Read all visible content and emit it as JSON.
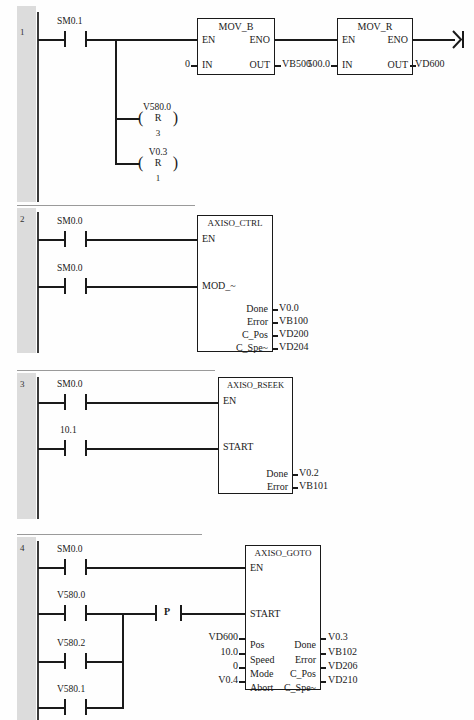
{
  "document": {
    "kind": "ladder-logic-program",
    "networks": [
      {
        "number": "1",
        "contacts": [
          {
            "label": "SM0.1",
            "type": "normally-open"
          }
        ],
        "blocks": [
          {
            "title": "MOV_B",
            "enable_pin": "EN",
            "eno_pin": "ENO",
            "in_pin": "IN",
            "out_pin": "OUT",
            "in_value": "0",
            "out_value": "VB500"
          },
          {
            "title": "MOV_R",
            "enable_pin": "EN",
            "eno_pin": "ENO",
            "in_pin": "IN",
            "out_pin": "OUT",
            "in_value": "500.0",
            "out_value": "VD600"
          }
        ],
        "coils": [
          {
            "label": "V580.0",
            "op": "R",
            "count": "3"
          },
          {
            "label": "V0.3",
            "op": "R",
            "count": "1"
          }
        ]
      },
      {
        "number": "2",
        "contacts": [
          {
            "label": "SM0.0",
            "type": "normally-open"
          },
          {
            "label": "SM0.0",
            "type": "normally-open"
          }
        ],
        "block": {
          "title": "AXISO_CTRL",
          "inputs": [
            {
              "pin": "EN",
              "value": ""
            },
            {
              "pin": "MOD_~",
              "value": ""
            }
          ],
          "outputs": [
            {
              "pin": "Done",
              "value": "V0.0"
            },
            {
              "pin": "Error",
              "value": "VB100"
            },
            {
              "pin": "C_Pos",
              "value": "VD200"
            },
            {
              "pin": "C_Spe~",
              "value": "VD204"
            }
          ]
        }
      },
      {
        "number": "3",
        "contacts": [
          {
            "label": "SM0.0",
            "type": "normally-open"
          },
          {
            "label": "10.1",
            "type": "normally-open"
          }
        ],
        "block": {
          "title": "AXISO_RSEEK",
          "inputs": [
            {
              "pin": "EN",
              "value": ""
            },
            {
              "pin": "START",
              "value": ""
            }
          ],
          "outputs": [
            {
              "pin": "Done",
              "value": "V0.2"
            },
            {
              "pin": "Error",
              "value": "VB101"
            }
          ]
        }
      },
      {
        "number": "4",
        "contacts": [
          {
            "label": "SM0.0",
            "type": "normally-open"
          },
          {
            "label": "V580.0",
            "type": "normally-open"
          },
          {
            "label": "V580.2",
            "type": "normally-open"
          },
          {
            "label": "V580.1",
            "type": "normally-open"
          }
        ],
        "positive_transition": {
          "label": "P"
        },
        "block": {
          "title": "AXISO_GOTO",
          "inputs": [
            {
              "pin": "EN",
              "value": ""
            },
            {
              "pin": "START",
              "value": ""
            },
            {
              "pin": "Pos",
              "value": "VD600"
            },
            {
              "pin": "Speed",
              "value": "10.0"
            },
            {
              "pin": "Mode",
              "value": "0"
            },
            {
              "pin": "Abort",
              "value": "V0.4"
            }
          ],
          "outputs": [
            {
              "pin": "Done",
              "value": "V0.3"
            },
            {
              "pin": "Error",
              "value": "VB102"
            },
            {
              "pin": "C_Pos",
              "value": "VD206"
            },
            {
              "pin": "C_Spe~",
              "value": "VD210"
            }
          ]
        }
      }
    ]
  }
}
